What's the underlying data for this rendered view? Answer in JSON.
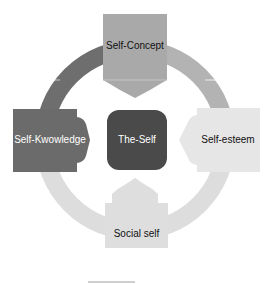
{
  "diagram": {
    "type": "cycle",
    "center": {
      "label": "The-Self",
      "color": "#4a4a4a",
      "text_color": "#ffffff"
    },
    "nodes": [
      {
        "position": "top",
        "label": "Self-Concept",
        "color": "#a9a9a9",
        "text_color": "#111111"
      },
      {
        "position": "right",
        "label": "Self-esteem",
        "color": "#e6e6e6",
        "text_color": "#111111"
      },
      {
        "position": "bottom",
        "label": "Social self",
        "color": "#dedede",
        "text_color": "#111111"
      },
      {
        "position": "left",
        "label": "Self-Kwowledge",
        "color": "#6b6b6b",
        "text_color": "#ffffff"
      }
    ],
    "ring_colors": {
      "top_left": "#6e6e6e",
      "top_right": "#b3b3b3",
      "bottom_right": "#dddddd",
      "bottom_left": "#dddddd"
    }
  }
}
